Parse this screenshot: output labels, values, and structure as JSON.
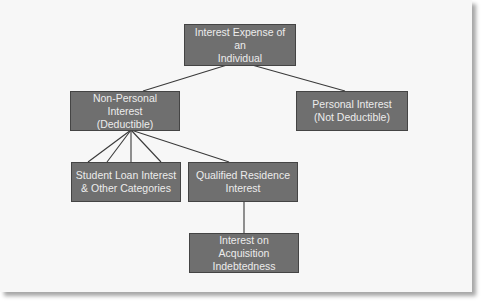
{
  "diagram": {
    "type": "hierarchy-tree",
    "colors": {
      "background": "#f7f7f7",
      "node_fill": "#6f6f6f",
      "node_border": "#444444",
      "node_text": "#ececec",
      "connector": "#3a3a3a"
    },
    "nodes": {
      "root": {
        "label": "Interest Expense of an\nIndividual"
      },
      "non_personal": {
        "label": "Non-Personal Interest\n(Deductible)"
      },
      "personal": {
        "label": "Personal Interest\n(Not Deductible)"
      },
      "student_loan": {
        "label": "Student Loan Interest\n& Other Categories"
      },
      "qualified_residence": {
        "label": "Qualified Residence\nInterest"
      },
      "acquisition": {
        "label": "Interest on Acquisition\nIndebtedness"
      }
    },
    "edges": [
      {
        "from": "root",
        "to": "non_personal"
      },
      {
        "from": "root",
        "to": "personal"
      },
      {
        "from": "non_personal",
        "to": "student_loan",
        "count": 4
      },
      {
        "from": "non_personal",
        "to": "qualified_residence"
      },
      {
        "from": "qualified_residence",
        "to": "acquisition"
      }
    ]
  }
}
